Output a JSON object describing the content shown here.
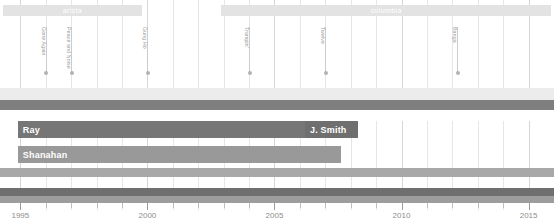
{
  "chart_data": {
    "type": "timeline",
    "title": "",
    "xlabel": "",
    "ylabel": "",
    "xlim": [
      1994.2,
      2016.0
    ],
    "grid": true,
    "axis": {
      "tick_labels": [
        "1995",
        "2000",
        "2005",
        "2010",
        "2015"
      ],
      "tick_years": [
        1995,
        2000,
        2005,
        2010,
        2015
      ],
      "minor_tick_years": [
        1996,
        1997,
        1998,
        1999,
        2001,
        2002,
        2003,
        2004,
        2006,
        2007,
        2008,
        2009,
        2011,
        2012,
        2013,
        2014
      ],
      "tick_color": "#9d9d9d"
    },
    "record_labels": [
      {
        "name": "arista",
        "start": 1994.3,
        "end": 1999.8,
        "color": "#e3e3e3",
        "text_color": "#ffffff"
      },
      {
        "name": "columbia",
        "start": 2002.9,
        "end": 2015.9,
        "color": "#e3e3e3",
        "text_color": "#ffffff"
      }
    ],
    "albums": [
      {
        "title": "Gone Again",
        "year": 1996.0,
        "stem_height": 46
      },
      {
        "title": "Peace and Noise",
        "year": 1997.0,
        "stem_height": 46
      },
      {
        "title": "Gung Ho",
        "year": 2000.0,
        "stem_height": 46
      },
      {
        "title": "Trampin'",
        "year": 2004.0,
        "stem_height": 46
      },
      {
        "title": "Twelve",
        "year": 2007.0,
        "stem_height": 46
      },
      {
        "title": "Banga",
        "year": 2012.2,
        "stem_height": 46
      }
    ],
    "bands": [
      {
        "name": "band-light-top",
        "start": 1994.2,
        "end": 2016.0,
        "color": "#ececec",
        "top": 88,
        "height": 12
      },
      {
        "name": "band-dark-upper",
        "start": 1994.2,
        "end": 2016.0,
        "color": "#7f7f7f",
        "top": 100,
        "height": 10
      },
      {
        "name": "band-mid-white",
        "start": 1994.2,
        "end": 2016.0,
        "color": "#ffffff",
        "top": 110,
        "height": 11
      },
      {
        "name": "band-grey-lower",
        "start": 1994.2,
        "end": 2016.0,
        "color": "#a8a8a8",
        "top": 168,
        "height": 9
      },
      {
        "name": "band-dark-bottom",
        "start": 1994.2,
        "end": 2016.0,
        "color": "#6f6f6f",
        "top": 188,
        "height": 12
      }
    ],
    "people": [
      {
        "name": "Ray",
        "start": 1994.9,
        "end": 2008.0,
        "color": "#767676",
        "top": 121
      },
      {
        "name": "J. Smith",
        "start": 2006.2,
        "end": 2008.3,
        "color": "#6f6f6f",
        "top": 121
      },
      {
        "name": "Shanahan",
        "start": 1994.9,
        "end": 2007.6,
        "color": "#999999",
        "top": 146
      }
    ]
  },
  "colors": {
    "background": "#ffffff",
    "grid_minor": "#e6e6e6",
    "grid_major": "#d6d6d6",
    "axis": "#9d9d9d",
    "album_stem": "#cccccc",
    "album_text": "#9a9a9a",
    "tick_text": "#8d8d8d"
  }
}
